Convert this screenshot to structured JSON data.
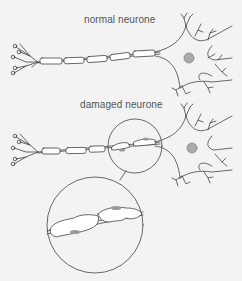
{
  "diagram": {
    "labels": {
      "normal": "normal neurone",
      "damaged": "damaged neurone"
    },
    "colors": {
      "background": "#f3f3f3",
      "line": "#444444",
      "nucleus": "#aaaaaa",
      "myelin_fill": "#ffffff",
      "damage_spot": "#999999"
    }
  }
}
